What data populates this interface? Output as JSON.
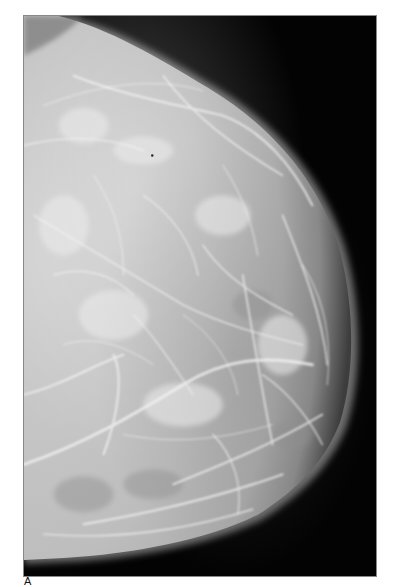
{
  "figure": {
    "type": "mammogram",
    "panel_label": "A",
    "colors": {
      "background": "#030303",
      "tissue_light": "#d8d8d8",
      "tissue_mid": "#a9a9a9",
      "page": "#ffffff"
    }
  }
}
